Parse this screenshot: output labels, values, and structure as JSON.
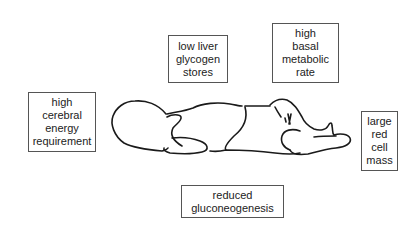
{
  "diagram": {
    "factors": [
      {
        "id": "cerebral",
        "lines": [
          "high",
          "cerebral",
          "energy",
          "requirement"
        ]
      },
      {
        "id": "liver",
        "lines": [
          "low liver",
          "glycogen",
          "stores"
        ]
      },
      {
        "id": "metabolic",
        "lines": [
          "high",
          "basal",
          "metabolic",
          "rate"
        ]
      },
      {
        "id": "redcell",
        "lines": [
          "large",
          "red",
          "cell",
          "mass"
        ]
      },
      {
        "id": "gluconeogenesis",
        "lines": [
          "reduced",
          "gluconeogenesis"
        ]
      }
    ],
    "colors": {
      "line": "#1a1a1a",
      "border": "#555555",
      "text": "#222222",
      "background": "#ffffff"
    }
  }
}
